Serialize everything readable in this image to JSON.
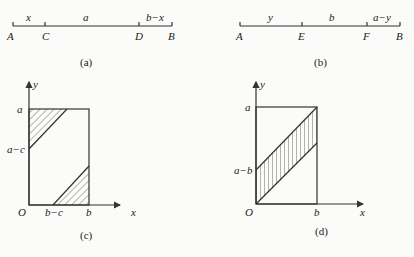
{
  "panels": {
    "a": {
      "caption": "(a)",
      "points": [
        "A",
        "C",
        "D",
        "B"
      ],
      "segments": [
        "x",
        "a",
        "b−x"
      ]
    },
    "b": {
      "caption": "(b)",
      "points": [
        "A",
        "E",
        "F",
        "B"
      ],
      "segments": [
        "y",
        "b",
        "a−y"
      ]
    },
    "c": {
      "caption": "(c)",
      "axis_x": "x",
      "axis_y": "y",
      "origin": "O",
      "y_ticks": [
        "a",
        "a−c"
      ],
      "x_ticks": [
        "b−c",
        "b"
      ]
    },
    "d": {
      "caption": "(d)",
      "axis_x": "x",
      "axis_y": "y",
      "origin": "O",
      "y_ticks": [
        "a",
        "a−b"
      ],
      "x_ticks": [
        "b"
      ]
    }
  },
  "colors": {
    "ink": "#333333",
    "background": "#fbfbf9"
  }
}
